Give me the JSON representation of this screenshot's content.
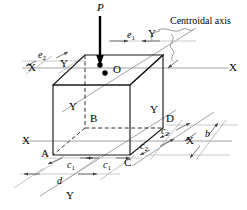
{
  "figure": {
    "kind": "isometric-block-eccentric-load-diagram",
    "title_annotation": "Centroidal axis",
    "load": {
      "symbol": "P",
      "direction": "downward",
      "type": "point-load"
    },
    "colors": {
      "outline": "#1a1a1a",
      "hidden_edge": "#333333",
      "axis_line": "#8c8c8c",
      "dimension_line": "#9a9a9a",
      "leader_line": "#8a8a8a",
      "load_arrow": "#000000",
      "point_marker": "#000000",
      "background": "#ffffff"
    },
    "corner_labels": [
      {
        "name": "O",
        "text": "O",
        "role": "centroid-top-face"
      },
      {
        "name": "A",
        "text": "A",
        "role": "front-bottom-left"
      },
      {
        "name": "B",
        "text": "B",
        "role": "hidden-rear-bottom-left"
      },
      {
        "name": "C",
        "text": "C",
        "role": "front-bottom-right"
      },
      {
        "name": "D",
        "text": "D",
        "role": "rear-bottom-right"
      }
    ],
    "axis_labels": {
      "x_top_left": "X",
      "x_top_right": "X",
      "x_bottom_left": "X",
      "x_bottom_right": "X",
      "y_top_right": "Y",
      "y_upper_inside": "Y",
      "y_left_inside": "Y",
      "y_right_inside": "Y",
      "y_bottom": "Y"
    },
    "dimensions": [
      {
        "name": "e1",
        "base": "e",
        "subscript": "1",
        "role": "load-eccentricity-x"
      },
      {
        "name": "e2",
        "base": "e",
        "subscript": "2",
        "role": "load-eccentricity-y"
      },
      {
        "name": "c1-left",
        "base": "c",
        "subscript": "1",
        "role": "half-width-left"
      },
      {
        "name": "c1-right",
        "base": "c",
        "subscript": "1",
        "role": "half-width-right"
      },
      {
        "name": "c2-upper",
        "base": "c",
        "subscript": "2",
        "role": "half-depth-upper"
      },
      {
        "name": "c2-lower",
        "base": "c",
        "subscript": "2",
        "role": "half-depth-lower"
      },
      {
        "name": "d",
        "base": "d",
        "subscript": "",
        "role": "total-width"
      },
      {
        "name": "b",
        "base": "b",
        "subscript": "",
        "role": "total-depth"
      }
    ]
  }
}
